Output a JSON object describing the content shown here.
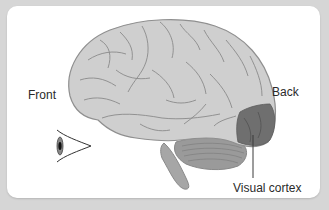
{
  "diagram": {
    "labels": {
      "front": "Front",
      "back": "Back",
      "visual_cortex": "Visual cortex"
    },
    "icons": {
      "eye": "eye-icon"
    },
    "colors": {
      "background": "#d6d6d6",
      "panel": "#ffffff",
      "brain_fill": "#cfcfcf",
      "brain_outline": "#8f8f8f",
      "sulci": "#8a8a8a",
      "visual_cortex": "#6f6f6f",
      "cerebellum": "#9a9a9a",
      "brainstem": "#a6a6a6",
      "text": "#2a2a2a"
    }
  }
}
